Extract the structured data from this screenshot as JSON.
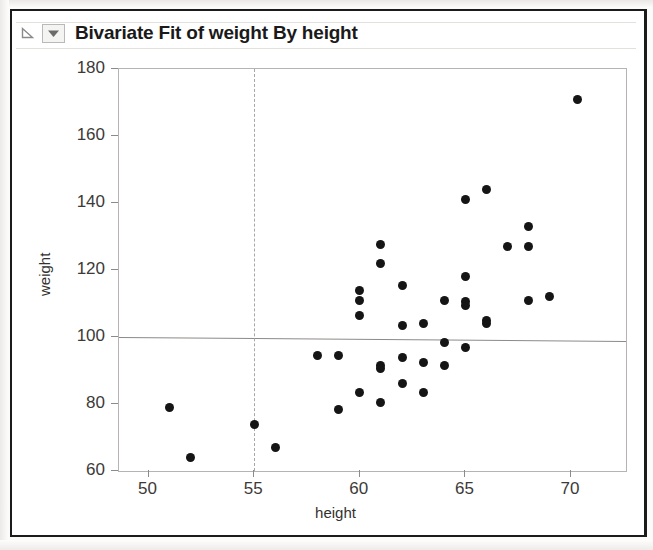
{
  "window": {
    "title_bar": {
      "disclosure_icon": "disclosure-triangle-icon",
      "menu_icon": "red-triangle-menu-icon",
      "title": "Bivariate Fit of weight By height"
    }
  },
  "chart_data": {
    "type": "scatter",
    "title": "Bivariate Fit of weight By height",
    "xlabel": "height",
    "ylabel": "weight",
    "xlim": [
      48.6,
      72.6
    ],
    "ylim": [
      60,
      180
    ],
    "xticks": [
      50,
      55,
      60,
      65,
      70
    ],
    "yticks": [
      60,
      80,
      100,
      120,
      140,
      160,
      180
    ],
    "grid": false,
    "legend": null,
    "annotations": [
      {
        "name": "mean-line",
        "type": "horizontal-line",
        "y": 100,
        "style": "solid",
        "color": "#8c8a88"
      },
      {
        "name": "vertical-reference-line",
        "type": "vertical-line",
        "x": 55,
        "style": "dashed",
        "color": "#a9a7a5"
      }
    ],
    "series": [
      {
        "name": "weight vs height",
        "marker": "filled-circle",
        "color": "#151515",
        "points": [
          [
            51.0,
            79.0
          ],
          [
            52.0,
            64.0
          ],
          [
            55.0,
            74.0
          ],
          [
            56.0,
            67.0
          ],
          [
            58.0,
            94.5
          ],
          [
            59.0,
            94.5
          ],
          [
            59.0,
            78.5
          ],
          [
            60.0,
            114.0
          ],
          [
            60.0,
            111.0
          ],
          [
            60.0,
            106.5
          ],
          [
            60.0,
            83.5
          ],
          [
            61.0,
            127.5
          ],
          [
            61.0,
            122.0
          ],
          [
            61.0,
            91.5
          ],
          [
            61.0,
            90.5
          ],
          [
            61.0,
            80.5
          ],
          [
            62.0,
            115.5
          ],
          [
            62.0,
            103.5
          ],
          [
            62.0,
            94.0
          ],
          [
            62.0,
            86.0
          ],
          [
            63.0,
            104.0
          ],
          [
            63.0,
            92.5
          ],
          [
            63.0,
            83.5
          ],
          [
            64.0,
            111.0
          ],
          [
            64.0,
            98.5
          ],
          [
            64.0,
            91.5
          ],
          [
            65.0,
            141.0
          ],
          [
            65.0,
            118.0
          ],
          [
            65.0,
            110.5
          ],
          [
            65.0,
            109.5
          ],
          [
            65.0,
            97.0
          ],
          [
            66.0,
            144.0
          ],
          [
            66.0,
            105.0
          ],
          [
            66.0,
            104.0
          ],
          [
            67.0,
            127.0
          ],
          [
            68.0,
            133.0
          ],
          [
            68.0,
            127.0
          ],
          [
            68.0,
            111.0
          ],
          [
            69.0,
            112.0
          ],
          [
            70.3,
            171.0
          ]
        ]
      }
    ]
  }
}
